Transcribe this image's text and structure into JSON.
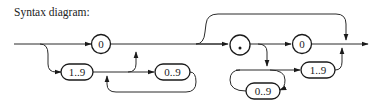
{
  "title": "Syntax diagram:",
  "diagram": {
    "type": "railroad",
    "colors": {
      "line": "#2a2a2a",
      "node_border": "#1a1a1a",
      "background": "#ffffff"
    },
    "integer_part": {
      "terminal_zero": "0",
      "first_digit": "1..9",
      "more_digits": "0..9"
    },
    "fraction_part": {
      "decimal_point": ".",
      "terminal_zero": "0",
      "last_digit": "1..9",
      "inner_digits": "0..9"
    }
  }
}
